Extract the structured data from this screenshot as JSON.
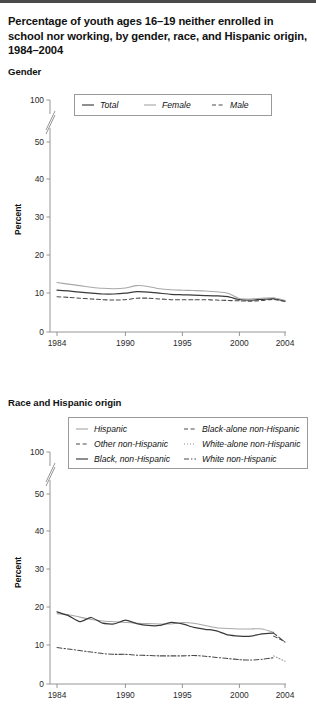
{
  "header": {
    "title": "Percentage of youth ages 16–19 neither enrolled in school nor working, by gender, race, and Hispanic origin, 1984–2004"
  },
  "sections": [
    {
      "label": "Gender"
    },
    {
      "label": "Race and Hispanic origin"
    }
  ],
  "axis": {
    "ylabel": "Percent",
    "yticks": [
      "100",
      "50",
      "40",
      "30",
      "20",
      "10",
      "0"
    ],
    "xticks": [
      "1984",
      "1990",
      "1995",
      "2000",
      "2004"
    ]
  },
  "colors": {
    "dark": "#3a3a3a",
    "mid": "#6f6f6f",
    "light": "#a8a8a8",
    "axis": "#8a8a8a",
    "text": "#1a1a1a"
  },
  "chart_data": [
    {
      "type": "line",
      "title": "Gender",
      "xlabel": "",
      "ylabel": "Percent",
      "xlim": [
        1984,
        2004
      ],
      "ylim": [
        0,
        100
      ],
      "yticks": [
        0,
        10,
        20,
        30,
        40,
        50,
        100
      ],
      "axis_break": "between 50 and 100",
      "grid": false,
      "legend_position": "top",
      "x": [
        1984,
        1985,
        1986,
        1987,
        1988,
        1989,
        1990,
        1991,
        1992,
        1993,
        1994,
        1995,
        1996,
        1997,
        1998,
        1999,
        2000,
        2001,
        2002,
        2003,
        2004
      ],
      "series": [
        {
          "name": "Total",
          "style": "solid",
          "color": "#3a3a3a",
          "values": [
            11.0,
            10.8,
            10.5,
            10.2,
            10.0,
            10.0,
            10.2,
            10.6,
            10.5,
            10.2,
            9.9,
            9.8,
            9.7,
            9.6,
            9.5,
            9.3,
            8.5,
            8.4,
            8.6,
            8.8,
            8.2
          ]
        },
        {
          "name": "Female",
          "style": "solid",
          "color": "#a8a8a8",
          "values": [
            13.0,
            12.6,
            12.2,
            11.8,
            11.5,
            11.4,
            11.6,
            12.2,
            12.0,
            11.4,
            11.1,
            11.0,
            10.9,
            10.8,
            10.6,
            10.2,
            8.8,
            8.7,
            8.9,
            9.0,
            8.3
          ]
        },
        {
          "name": "Male",
          "style": "dashed",
          "color": "#4a4a4a",
          "values": [
            9.3,
            9.1,
            8.9,
            8.7,
            8.5,
            8.4,
            8.5,
            8.9,
            8.9,
            8.7,
            8.5,
            8.5,
            8.5,
            8.5,
            8.4,
            8.3,
            8.2,
            8.1,
            8.3,
            8.6,
            8.0
          ]
        }
      ]
    },
    {
      "type": "line",
      "title": "Race and Hispanic origin",
      "xlabel": "",
      "ylabel": "Percent",
      "xlim": [
        1984,
        2004
      ],
      "ylim": [
        0,
        100
      ],
      "yticks": [
        0,
        10,
        20,
        30,
        40,
        50,
        100
      ],
      "axis_break": "between 50 and 100",
      "grid": false,
      "legend_position": "top",
      "x": [
        1984,
        1985,
        1986,
        1987,
        1988,
        1989,
        1990,
        1991,
        1992,
        1993,
        1994,
        1995,
        1996,
        1997,
        1998,
        1999,
        2000,
        2001,
        2002,
        2003,
        2004
      ],
      "series": [
        {
          "name": "Hispanic",
          "style": "solid",
          "color": "#a8a8a8",
          "values": [
            18.5,
            18.2,
            17.6,
            17.0,
            16.6,
            16.4,
            16.2,
            16.0,
            15.9,
            15.8,
            15.8,
            16.2,
            16.0,
            15.4,
            14.8,
            14.6,
            14.5,
            14.5,
            14.5,
            13.6,
            null
          ]
        },
        {
          "name": "Other non-Hispanic",
          "style": "dashed",
          "color": "#4a4a4a",
          "values": [
            null,
            null,
            null,
            null,
            null,
            null,
            null,
            null,
            null,
            null,
            null,
            null,
            null,
            null,
            null,
            null,
            null,
            null,
            null,
            12.6,
            11.2
          ]
        },
        {
          "name": "Black, non-Hispanic",
          "style": "solid",
          "color": "#3a3a3a",
          "values": [
            19.0,
            18.0,
            16.4,
            17.5,
            16.0,
            15.8,
            16.8,
            15.9,
            15.4,
            15.4,
            16.2,
            15.8,
            14.9,
            14.4,
            14.0,
            12.9,
            12.6,
            12.6,
            13.2,
            13.4,
            null
          ]
        },
        {
          "name": "Black-alone non-Hispanic",
          "style": "dashed",
          "color": "#4a4a4a",
          "values": [
            null,
            null,
            null,
            null,
            null,
            null,
            null,
            null,
            null,
            null,
            null,
            null,
            null,
            null,
            null,
            null,
            null,
            null,
            null,
            13.4,
            11.0
          ]
        },
        {
          "name": "White-alone non-Hispanic",
          "style": "dotted",
          "color": "#8a8a8a",
          "values": [
            null,
            null,
            null,
            null,
            null,
            null,
            null,
            null,
            null,
            null,
            null,
            null,
            null,
            null,
            null,
            null,
            null,
            null,
            null,
            7.4,
            6.0
          ]
        },
        {
          "name": "White non-Hispanic",
          "style": "dashdot",
          "color": "#4a4a4a",
          "values": [
            9.6,
            9.2,
            8.8,
            8.4,
            8.0,
            7.8,
            7.8,
            7.6,
            7.5,
            7.4,
            7.4,
            7.4,
            7.5,
            7.3,
            7.0,
            6.7,
            6.4,
            6.3,
            6.5,
            6.9,
            null
          ]
        }
      ]
    }
  ],
  "legends": [
    {
      "rows": [
        [
          {
            "label": "Total",
            "style": "solid",
            "color": "#3a3a3a"
          },
          {
            "label": "Female",
            "style": "solid",
            "color": "#a8a8a8"
          },
          {
            "label": "Male",
            "style": "dashed",
            "color": "#4a4a4a"
          }
        ]
      ]
    },
    {
      "rows": [
        [
          {
            "label": "Hispanic",
            "style": "solid",
            "color": "#a8a8a8"
          },
          {
            "label": "Black-alone non-Hispanic",
            "style": "dashed",
            "color": "#4a4a4a"
          }
        ],
        [
          {
            "label": "Other non-Hispanic",
            "style": "dashed",
            "color": "#4a4a4a"
          },
          {
            "label": "White-alone non-Hispanic",
            "style": "dotted",
            "color": "#8a8a8a"
          }
        ],
        [
          {
            "label": "Black, non-Hispanic",
            "style": "solid",
            "color": "#3a3a3a"
          },
          {
            "label": "White non-Hispanic",
            "style": "dashdot",
            "color": "#4a4a4a"
          }
        ]
      ]
    }
  ]
}
